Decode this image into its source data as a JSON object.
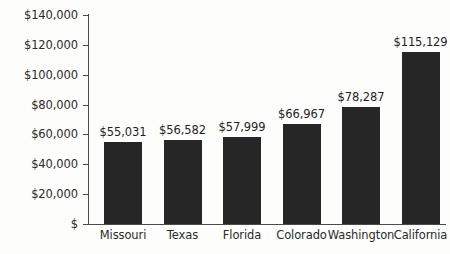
{
  "chart_data": {
    "type": "bar",
    "title": "",
    "xlabel": "",
    "ylabel": "",
    "categories": [
      "Missouri",
      "Texas",
      "Florida",
      "Colorado",
      "Washington",
      "California"
    ],
    "values": [
      55031,
      56582,
      57999,
      66967,
      78287,
      115129
    ],
    "value_labels": [
      "$55,031",
      "$56,582",
      "$57,999",
      "$66,967",
      "$78,287",
      "$115,129"
    ],
    "ylim": [
      0,
      140000
    ],
    "ytick_values": [
      0,
      20000,
      40000,
      60000,
      80000,
      100000,
      120000,
      140000
    ],
    "ytick_labels": [
      "$",
      "$20,000",
      "$40,000",
      "$60,000",
      "$80,000",
      "$100,000",
      "$120,000",
      "$140,000"
    ],
    "grid": false,
    "legend": null,
    "bar_color": "#262626",
    "axis_color": "#4a4a4a",
    "background_color": "#fdfdfc",
    "text_color": "#2b2b2b"
  }
}
